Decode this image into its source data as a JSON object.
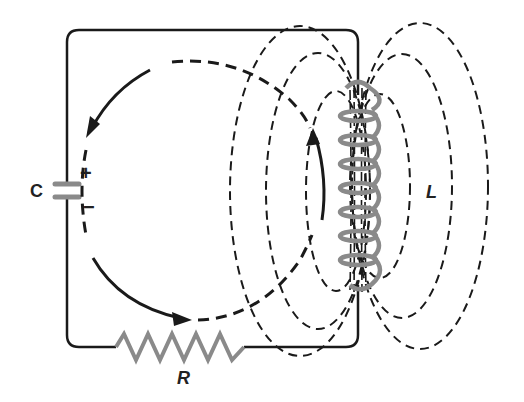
{
  "diagram": {
    "labels": {
      "capacitor": "C",
      "plus": "+",
      "minus": "−",
      "resistor": "R",
      "inductor": "L"
    },
    "colors": {
      "wire": "#1a1a1a",
      "component": "#8a8a8a",
      "field_line": "#1a1a1a",
      "background": "#ffffff"
    }
  }
}
